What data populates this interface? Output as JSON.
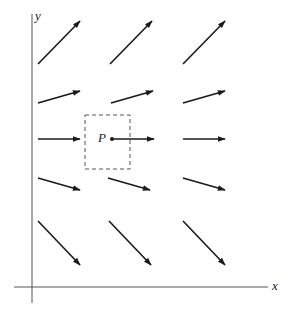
{
  "diagram": {
    "type": "vector-field",
    "axes": {
      "x_label": "x",
      "y_label": "y"
    },
    "point": {
      "label": "P"
    },
    "colors": {
      "ink": "#1a1a1a",
      "axis": "#444444",
      "box": "#555555"
    },
    "arrows": [
      {
        "row": 1,
        "x1": 38,
        "y1": 64,
        "x2": 80,
        "y2": 21
      },
      {
        "row": 1,
        "x1": 110,
        "y1": 64,
        "x2": 152,
        "y2": 21
      },
      {
        "row": 1,
        "x1": 183,
        "y1": 64,
        "x2": 225,
        "y2": 21
      },
      {
        "row": 2,
        "x1": 38,
        "y1": 103,
        "x2": 80,
        "y2": 91
      },
      {
        "row": 2,
        "x1": 111,
        "y1": 103,
        "x2": 153,
        "y2": 91
      },
      {
        "row": 2,
        "x1": 183,
        "y1": 103,
        "x2": 225,
        "y2": 91
      },
      {
        "row": 3,
        "x1": 38,
        "y1": 139,
        "x2": 80,
        "y2": 139
      },
      {
        "row": 3,
        "x1": 112,
        "y1": 139,
        "x2": 154,
        "y2": 139
      },
      {
        "row": 3,
        "x1": 183,
        "y1": 139,
        "x2": 225,
        "y2": 139
      },
      {
        "row": 4,
        "x1": 38,
        "y1": 178,
        "x2": 80,
        "y2": 190
      },
      {
        "row": 4,
        "x1": 108,
        "y1": 178,
        "x2": 150,
        "y2": 190
      },
      {
        "row": 4,
        "x1": 183,
        "y1": 178,
        "x2": 225,
        "y2": 190
      },
      {
        "row": 5,
        "x1": 38,
        "y1": 221,
        "x2": 80,
        "y2": 265
      },
      {
        "row": 5,
        "x1": 109,
        "y1": 221,
        "x2": 151,
        "y2": 265
      },
      {
        "row": 5,
        "x1": 183,
        "y1": 221,
        "x2": 225,
        "y2": 265
      }
    ]
  }
}
